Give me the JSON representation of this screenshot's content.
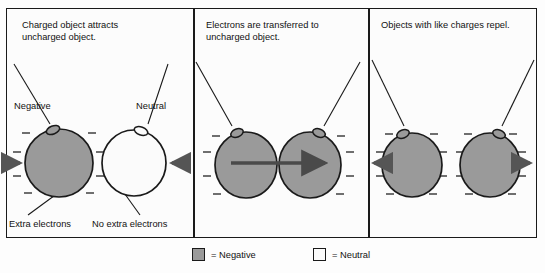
{
  "figure": {
    "kind": "physics-diagram",
    "panels": [
      {
        "id": "panel-attract",
        "title": "Charged object attracts\nuncharged object.",
        "objects": [
          {
            "id": "sphere-negative",
            "label": "Negative",
            "bottom_label": "Extra electrons",
            "fill": "#9a9a9a",
            "charge": "negative",
            "charge_marks": 8,
            "charge_symbol": "–"
          },
          {
            "id": "sphere-neutral",
            "label": "Neutral",
            "bottom_label": "No extra electrons",
            "fill": "#fbfbfb",
            "charge": "neutral",
            "charge_marks": 0,
            "charge_symbol": ""
          }
        ],
        "arrows": [
          {
            "id": "arrow-attract-left",
            "direction": "right"
          },
          {
            "id": "arrow-attract-right",
            "direction": "left"
          }
        ]
      },
      {
        "id": "panel-transfer",
        "title": "Electrons are transferred to\nuncharged object.",
        "objects": [
          {
            "id": "sphere-transfer-left",
            "label": "",
            "bottom_label": "",
            "fill": "#9a9a9a",
            "charge": "negative",
            "charge_marks": 8,
            "charge_symbol": "–"
          },
          {
            "id": "sphere-transfer-right",
            "label": "",
            "bottom_label": "",
            "fill": "#9a9a9a",
            "charge": "negative",
            "charge_marks": 8,
            "charge_symbol": "–"
          }
        ],
        "arrows": [
          {
            "id": "arrow-electron-flow",
            "direction": "right"
          }
        ]
      },
      {
        "id": "panel-repel",
        "title": "Objects with like charges repel.",
        "objects": [
          {
            "id": "sphere-repel-left",
            "label": "",
            "bottom_label": "",
            "fill": "#9a9a9a",
            "charge": "negative",
            "charge_marks": 8,
            "charge_symbol": "–"
          },
          {
            "id": "sphere-repel-right",
            "label": "",
            "bottom_label": "",
            "fill": "#9a9a9a",
            "charge": "negative",
            "charge_marks": 8,
            "charge_symbol": "–"
          }
        ],
        "arrows": [
          {
            "id": "arrow-repel-left",
            "direction": "left"
          },
          {
            "id": "arrow-repel-right",
            "direction": "right"
          }
        ]
      }
    ],
    "legend": {
      "entries": [
        {
          "id": "legend-negative",
          "swatch_color": "#9a9a9a",
          "text": "= Negative"
        },
        {
          "id": "legend-neutral",
          "swatch_color": "#fbfbfb",
          "text": "= Neutral"
        }
      ]
    },
    "colors": {
      "stroke": "#1a1a1a",
      "negative_fill": "#9a9a9a",
      "neutral_fill": "#fbfbfb",
      "background": "#fcfcfc",
      "arrow": "#555555"
    }
  }
}
